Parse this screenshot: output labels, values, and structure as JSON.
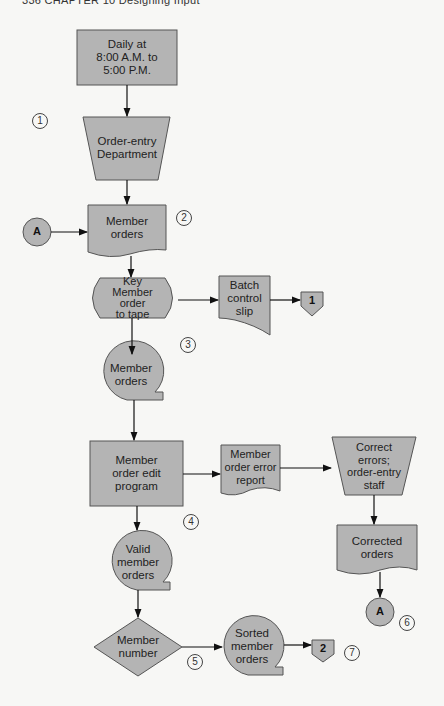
{
  "header": {
    "text": "336  CHAPTER 10  Designing Input"
  },
  "colors": {
    "shape_fill": "#b4b4b4",
    "stroke": "#555555",
    "arrow": "#111111",
    "background": "#f7f7f5"
  },
  "nodes": {
    "schedule": {
      "shape": "rectangle",
      "label": "Daily at\n8:00 A.M. to\n5:00 P.M."
    },
    "order_entry_dept": {
      "shape": "manual-operation",
      "label": "Order-entry\nDepartment"
    },
    "member_orders_doc": {
      "shape": "document",
      "label": "Member\norders"
    },
    "key_to_tape": {
      "shape": "offline-keying",
      "label": "Key\nMember\norder\nto tape"
    },
    "batch_control_slip": {
      "shape": "document",
      "label": "Batch\ncontrol\nslip"
    },
    "member_orders_tape": {
      "shape": "magnetic-tape",
      "label": "Member\norders"
    },
    "edit_program": {
      "shape": "process",
      "label": "Member\norder edit\nprogram"
    },
    "error_report": {
      "shape": "document",
      "label": "Member\norder error\nreport"
    },
    "correct_errors": {
      "shape": "manual-operation",
      "label": "Correct\nerrors;\norder-entry\nstaff"
    },
    "corrected_orders": {
      "shape": "document",
      "label": "Corrected\norders"
    },
    "valid_orders": {
      "shape": "magnetic-tape",
      "label": "Valid\nmember\norders"
    },
    "member_number": {
      "shape": "decision",
      "label": "Member\nnumber"
    },
    "sorted_orders": {
      "shape": "magnetic-tape",
      "label": "Sorted\nmember\norders"
    }
  },
  "connectors": {
    "a_in": {
      "label": "A"
    },
    "a_out": {
      "label": "A"
    },
    "page1": {
      "label": "1"
    },
    "page2": {
      "label": "2"
    }
  },
  "steps": [
    "1",
    "2",
    "3",
    "4",
    "5",
    "6",
    "7"
  ]
}
